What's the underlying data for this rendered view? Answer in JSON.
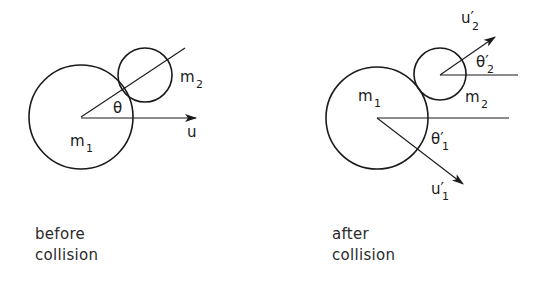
{
  "before": {
    "labels": {
      "m1": "m",
      "m1_sub": "1",
      "m2": "m",
      "m2_sub": "2",
      "theta": "θ",
      "u": "u"
    },
    "caption": [
      "before",
      "collision"
    ]
  },
  "after": {
    "labels": {
      "m1": "m",
      "m1_sub": "1",
      "m2": "m",
      "m2_sub": "2",
      "theta1": "θ′",
      "theta1_sub": "1",
      "theta2": "θ′",
      "theta2_sub": "2",
      "u1": "u′",
      "u1_sub": "1",
      "u2": "u′",
      "u2_sub": "2"
    },
    "caption": [
      "after",
      "collision"
    ]
  },
  "colors": {
    "ink": "#1a1a1a",
    "background": "#ffffff"
  }
}
